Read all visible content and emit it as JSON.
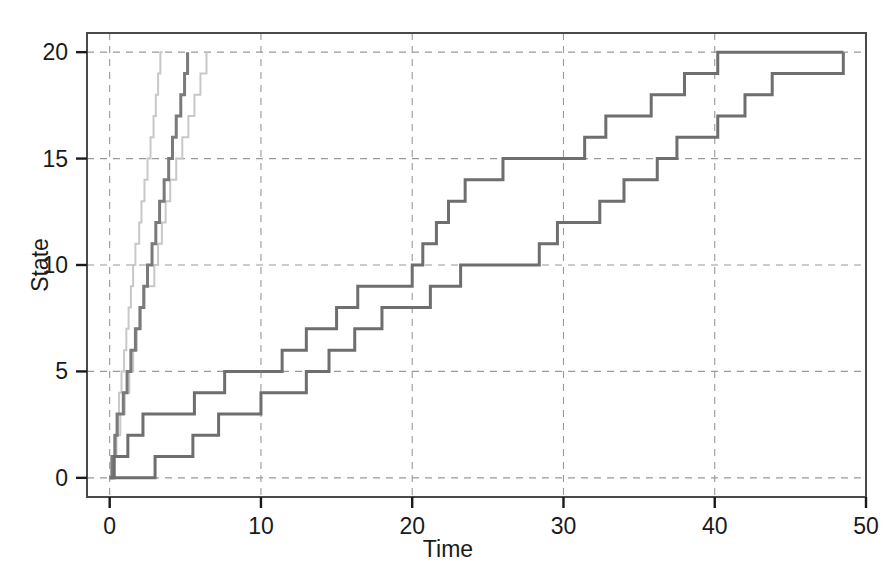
{
  "chart_data": {
    "type": "line",
    "title": "",
    "xlabel": "Time",
    "ylabel": "State",
    "xlim": [
      -1.5,
      50
    ],
    "ylim": [
      -0.9,
      20.9
    ],
    "xticks": [
      0,
      10,
      20,
      30,
      40,
      50
    ],
    "yticks": [
      0,
      5,
      10,
      15,
      20
    ],
    "grid": true,
    "grid_style": "dashed",
    "grid_color": "#999999",
    "legend": "none",
    "step_style": "post",
    "series": [
      {
        "name": "fast-path-1",
        "color": "#c8c8c8",
        "linewidth": 2,
        "x": [
          0,
          0.12,
          0.3,
          0.45,
          0.62,
          0.78,
          0.95,
          1.1,
          1.25,
          1.4,
          1.55,
          1.7,
          1.95,
          2.1,
          2.3,
          2.5,
          2.7,
          2.9,
          3.05,
          3.2,
          3.35,
          3.5
        ],
        "y": [
          0,
          1,
          2,
          3,
          4,
          5,
          6,
          7,
          8,
          9,
          10,
          11,
          12,
          13,
          14,
          15,
          16,
          17,
          18,
          19,
          20,
          20
        ]
      },
      {
        "name": "fast-path-2",
        "color": "#c8c8c8",
        "linewidth": 2,
        "x": [
          0,
          0.2,
          0.45,
          0.7,
          1.0,
          1.3,
          1.55,
          1.8,
          2.05,
          2.3,
          2.6,
          2.95,
          3.2,
          3.45,
          3.7,
          4.0,
          4.4,
          4.8,
          5.2,
          5.6,
          6.0,
          6.4
        ],
        "y": [
          0,
          1,
          2,
          3,
          4,
          5,
          6,
          7,
          8,
          9,
          9,
          10,
          11,
          12,
          13,
          14,
          15,
          16,
          17,
          18,
          19,
          20
        ]
      },
      {
        "name": "fast-path-3",
        "color": "#7a7a7a",
        "linewidth": 3,
        "x": [
          0,
          0.15,
          0.35,
          0.5,
          0.7,
          0.9,
          1.15,
          1.4,
          1.7,
          2.0,
          2.25,
          2.5,
          2.8,
          3.05,
          3.3,
          3.6,
          3.9,
          4.15,
          4.4,
          4.7,
          4.95,
          5.15
        ],
        "y": [
          0,
          1,
          2,
          3,
          3,
          4,
          5,
          6,
          7,
          8,
          9,
          10,
          11,
          12,
          13,
          14,
          15,
          16,
          17,
          18,
          19,
          20
        ]
      },
      {
        "name": "slow-path-1",
        "color": "#6e6e6e",
        "linewidth": 3,
        "x": [
          0,
          0.3,
          1.2,
          2.2,
          4.0,
          5.6,
          7.6,
          9.0,
          11.4,
          13.0,
          15.0,
          16.4,
          18.5,
          20.0,
          20.7,
          21.6,
          22.4,
          23.5,
          26.0,
          29.0,
          31.4,
          32.8,
          34.3,
          35.8,
          38.0,
          40.2,
          48.5
        ],
        "y": [
          0,
          1,
          2,
          3,
          3,
          4,
          5,
          5,
          6,
          7,
          8,
          9,
          9,
          10,
          11,
          12,
          13,
          14,
          15,
          15,
          16,
          17,
          17,
          18,
          19,
          20,
          20
        ]
      },
      {
        "name": "slow-path-2",
        "color": "#6e6e6e",
        "linewidth": 3,
        "x": [
          0,
          2.0,
          3.0,
          4.3,
          5.5,
          7.2,
          8.7,
          10.0,
          13.0,
          14.5,
          16.2,
          18.0,
          20.0,
          21.2,
          23.2,
          25.0,
          27.4,
          28.4,
          29.6,
          32.4,
          34.0,
          36.2,
          37.5,
          40.2,
          42.0,
          43.8,
          48.5
        ],
        "y": [
          0,
          0,
          1,
          1,
          2,
          3,
          3,
          4,
          5,
          6,
          7,
          8,
          8,
          9,
          10,
          10,
          10,
          11,
          12,
          13,
          14,
          15,
          16,
          17,
          18,
          19,
          20
        ]
      }
    ]
  },
  "axes": {
    "ylabel": "State",
    "xlabel": "Time",
    "ytick_labels": [
      "0",
      "5",
      "10",
      "15",
      "20"
    ],
    "xtick_labels": [
      "0",
      "10",
      "20",
      "30",
      "40",
      "50"
    ]
  }
}
